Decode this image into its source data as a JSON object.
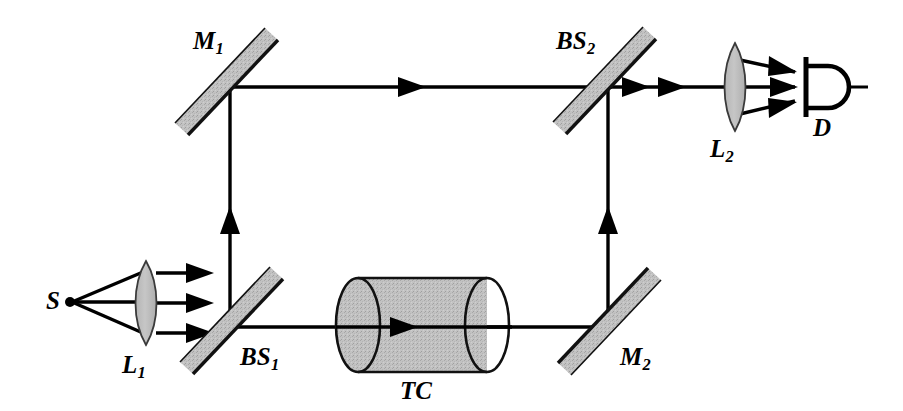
{
  "figure": {
    "kind": "optical-interferometer-schematic",
    "background_color": "#ffffff",
    "line_color": "#000000",
    "element_fill": "#bfbfbf",
    "element_edge": "#1a1a1a"
  },
  "labels": {
    "source": {
      "text": "S",
      "sub": ""
    },
    "lens_1": {
      "text": "L",
      "sub": "1"
    },
    "beamsplitter_1": {
      "text": "BS",
      "sub": "1"
    },
    "mirror_1": {
      "text": "M",
      "sub": "1"
    },
    "test_cell": {
      "text": "TC",
      "sub": ""
    },
    "mirror_2": {
      "text": "M",
      "sub": "2"
    },
    "beamsplitter_2": {
      "text": "BS",
      "sub": "2"
    },
    "lens_2": {
      "text": "L",
      "sub": "2"
    },
    "detector": {
      "text": "D",
      "sub": ""
    }
  },
  "components": [
    {
      "id": "source",
      "name": "S",
      "type": "point-source",
      "x": 70,
      "y": 302
    },
    {
      "id": "lens-1",
      "name": "L1",
      "type": "lens",
      "x": 146,
      "y": 303
    },
    {
      "id": "beamsplitter-1",
      "name": "BS1",
      "type": "beam-splitter",
      "x": 230,
      "y": 327
    },
    {
      "id": "mirror-1",
      "name": "M1",
      "type": "mirror",
      "x": 230,
      "y": 87
    },
    {
      "id": "test-cell",
      "name": "TC",
      "type": "cylinder-cell",
      "x": 420,
      "y": 325
    },
    {
      "id": "mirror-2",
      "name": "M2",
      "type": "mirror",
      "x": 608,
      "y": 327
    },
    {
      "id": "beamsplitter-2",
      "name": "BS2",
      "type": "beam-splitter",
      "x": 608,
      "y": 87
    },
    {
      "id": "lens-2",
      "name": "L2",
      "type": "lens",
      "x": 735,
      "y": 87
    },
    {
      "id": "detector",
      "name": "D",
      "type": "photodetector",
      "x": 825,
      "y": 87
    }
  ],
  "beam_paths": [
    {
      "id": "source-to-lens-1",
      "from": "source",
      "to": "lens-1",
      "orientation": "diverging"
    },
    {
      "id": "lens-1-to-bs1",
      "from": "lens-1",
      "to": "beamsplitter-1",
      "orientation": "horizontal"
    },
    {
      "id": "bs1-to-m1",
      "from": "beamsplitter-1",
      "to": "mirror-1",
      "orientation": "vertical"
    },
    {
      "id": "m1-to-bs2",
      "from": "mirror-1",
      "to": "beamsplitter-2",
      "orientation": "horizontal"
    },
    {
      "id": "bs1-to-tc",
      "from": "beamsplitter-1",
      "to": "test-cell",
      "orientation": "horizontal"
    },
    {
      "id": "tc-to-m2",
      "from": "test-cell",
      "to": "mirror-2",
      "orientation": "horizontal"
    },
    {
      "id": "m2-to-bs2",
      "from": "mirror-2",
      "to": "beamsplitter-2",
      "orientation": "vertical"
    },
    {
      "id": "bs2-to-lens-2",
      "from": "beamsplitter-2",
      "to": "lens-2",
      "orientation": "horizontal"
    },
    {
      "id": "lens-2-to-detector",
      "from": "lens-2",
      "to": "detector",
      "orientation": "converging"
    }
  ]
}
